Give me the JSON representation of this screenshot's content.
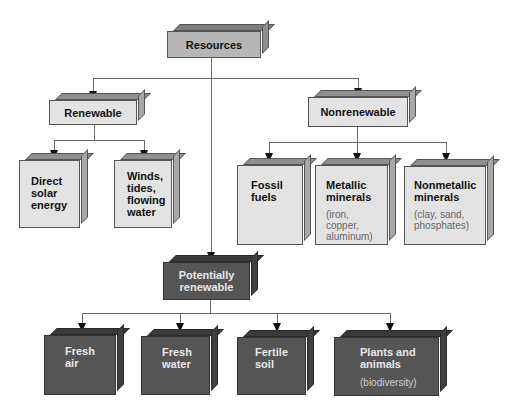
{
  "diagram": {
    "type": "hierarchy",
    "root": {
      "label": "Resources"
    },
    "categories": [
      {
        "label": "Renewable",
        "children": [
          {
            "label": "Direct solar energy",
            "lines": [
              "Direct",
              "solar",
              "energy"
            ]
          },
          {
            "label": "Winds, tides, flowing water",
            "lines": [
              "Winds,",
              "tides,",
              "flowing",
              "water"
            ]
          }
        ]
      },
      {
        "label": "Nonrenewable",
        "children": [
          {
            "label": "Fossil fuels",
            "lines": [
              "Fossil",
              "fuels"
            ]
          },
          {
            "label": "Metallic minerals",
            "lines": [
              "Metallic",
              "minerals"
            ],
            "examples": [
              "(iron,",
              "copper,",
              "aluminum)"
            ]
          },
          {
            "label": "Nonmetallic minerals",
            "lines": [
              "Nonmetallic",
              "minerals"
            ],
            "examples": [
              "(clay, sand,",
              "phosphates)"
            ]
          }
        ]
      },
      {
        "label": "Potentially renewable",
        "lines": [
          "Potentially",
          "renewable"
        ],
        "children": [
          {
            "label": "Fresh air",
            "lines": [
              "Fresh",
              "air"
            ]
          },
          {
            "label": "Fresh water",
            "lines": [
              "Fresh",
              "water"
            ]
          },
          {
            "label": "Fertile soil",
            "lines": [
              "Fertile",
              "soil"
            ]
          },
          {
            "label": "Plants and animals",
            "lines": [
              "Plants and",
              "animals"
            ],
            "examples": [
              "(biodiversity)"
            ]
          }
        ]
      }
    ],
    "colors": {
      "light_box": "#e3e3e3",
      "root_box": "#b6b6b6",
      "dark_box": "#555555",
      "connector": "#6a6a6a"
    }
  }
}
